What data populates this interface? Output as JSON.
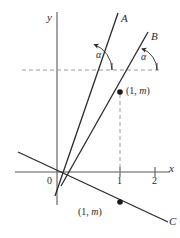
{
  "figure": {
    "colors": {
      "ink": "#2b2b2b",
      "axis": "#5a5a5a",
      "dash": "#9a9a9a",
      "background": "#ffffff"
    },
    "axes": {
      "x_label": "x",
      "y_label": "y",
      "origin_label": "0",
      "x_ticks": [
        {
          "label": "1",
          "value": 1
        },
        {
          "label": "2",
          "value": 2
        }
      ]
    },
    "lines": [
      {
        "name": "A",
        "label": "A"
      },
      {
        "name": "B",
        "label": "B"
      },
      {
        "name": "C",
        "label": "C"
      }
    ],
    "angles": [
      {
        "name": "alpha-line-a",
        "label": "α"
      },
      {
        "name": "alpha-line-b",
        "label": "α"
      }
    ],
    "points": [
      {
        "name": "point-on-line-b",
        "open": "(1, ",
        "var": "m",
        "close": ")"
      },
      {
        "name": "point-on-line-c",
        "open": "(1, ",
        "var": "m",
        "close": ")"
      }
    ]
  }
}
